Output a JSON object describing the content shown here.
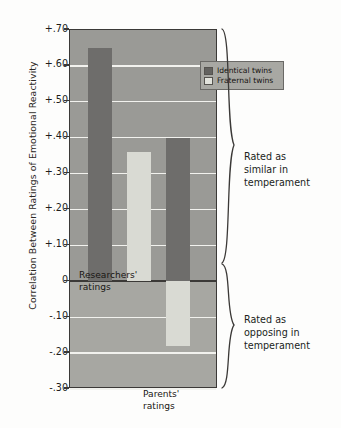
{
  "chart_data": {
    "type": "bar",
    "title": "",
    "xlabel": "",
    "ylabel": "Correlation Between Ratings of Emotional Reactivity",
    "ylim": [
      -0.3,
      0.7
    ],
    "grid": true,
    "legend_position": "top-right",
    "yticks": [
      "+.70",
      "+.60",
      "+.50",
      "+.40",
      "+.30",
      "+.20",
      "+.10",
      "0",
      "-.10",
      "-.20",
      "-.30"
    ],
    "ytick_values": [
      0.7,
      0.6,
      0.5,
      0.4,
      0.3,
      0.2,
      0.1,
      0.0,
      -0.1,
      -0.2,
      -0.3
    ],
    "categories": [
      "Researchers' ratings",
      "Parents' ratings"
    ],
    "series": [
      {
        "name": "Identical twins",
        "values": [
          0.65,
          0.4
        ],
        "color": "#6e6d6b"
      },
      {
        "name": "Fraternal twins",
        "values": [
          0.36,
          -0.18
        ],
        "color": "#d9dad3"
      }
    ],
    "bars": [
      {
        "label": "Identical twins",
        "group": "Researchers' ratings",
        "value": 0.65,
        "style": "dark"
      },
      {
        "label": "Fraternal twins",
        "group": "Researchers' ratings",
        "value": 0.36,
        "style": "light"
      },
      {
        "label": "Identical twins",
        "group": "Parents' ratings",
        "value": 0.4,
        "style": "dark"
      },
      {
        "label": "Fraternal twins",
        "group": "Parents' ratings",
        "value": -0.18,
        "style": "light"
      }
    ],
    "annotations": [
      {
        "text": "Rated as similar in temperament",
        "region": "positive"
      },
      {
        "text": "Rated as opposing in temperament",
        "region": "negative"
      }
    ]
  },
  "legend": {
    "items": [
      {
        "label": "Identical twins",
        "swatch": "dark"
      },
      {
        "label": "Fraternal twins",
        "swatch": "light"
      }
    ]
  },
  "axis": {
    "y_title": "Correlation Between Ratings of Emotional Reactivity",
    "ticks": [
      "+.70",
      "+.60",
      "+.50",
      "+.40",
      "+.30",
      "+.20",
      "+.10",
      "0",
      "-.10",
      "-.20",
      "-.30"
    ]
  },
  "group_labels": {
    "researchers_line1": "Researchers'",
    "researchers_line2": "ratings",
    "parents_line1": "Parents'",
    "parents_line2": "ratings"
  },
  "annotations": {
    "similar_line1": "Rated as",
    "similar_line2": "similar in",
    "similar_line3": "temperament",
    "opposing_line1": "Rated as",
    "opposing_line2": "opposing in",
    "opposing_line3": "temperament"
  },
  "colors": {
    "identical_twins": "#6e6d6b",
    "fraternal_twins": "#d9dad3",
    "plot_background_positive": "#9a9a96",
    "plot_background_negative": "#a7a7a2",
    "gridline": "#f2f2ee",
    "axis": "#3b3937"
  }
}
